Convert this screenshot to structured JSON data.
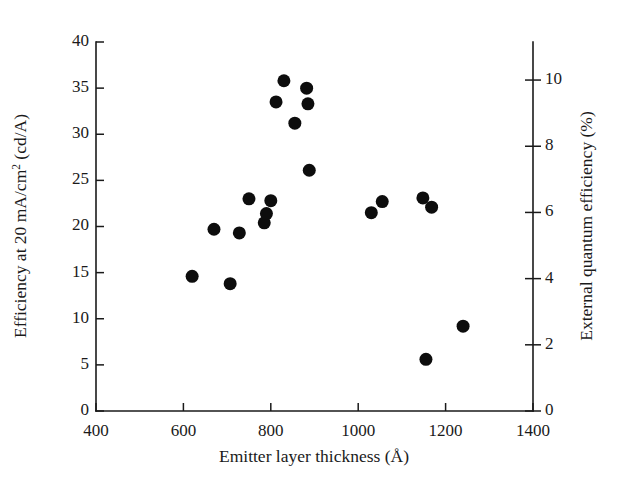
{
  "figure": {
    "background": "#ffffff",
    "marker_color": "#0d0d0d",
    "axis_color": "#1a1a1a"
  },
  "chart_data": {
    "type": "scatter",
    "title": "",
    "xlabel": "Emitter layer thickness (Å)",
    "ylabel": "Efficiency at 20 mA/cm² (cd/A)",
    "y2label": "External quantum efficiency (%)",
    "xlim": [
      400,
      1400
    ],
    "ylim": [
      0,
      40
    ],
    "y2lim": [
      0,
      11.15
    ],
    "xticks": [
      400,
      600,
      800,
      1000,
      1200,
      1400
    ],
    "xticklabels": [
      "400",
      "600",
      "800",
      "1000",
      "1200",
      "1400"
    ],
    "yticks": [
      0,
      5,
      10,
      15,
      20,
      25,
      30,
      35,
      40
    ],
    "yticklabels": [
      "0",
      "5",
      "10",
      "15",
      "20",
      "25",
      "30",
      "35",
      "40"
    ],
    "y2ticks": [
      0,
      2,
      4,
      6,
      8,
      10
    ],
    "y2ticklabels": [
      "0",
      "2",
      "4",
      "6",
      "8",
      "10"
    ],
    "grid": false,
    "legend": false,
    "marker": "filled-circle",
    "marker_size": 13,
    "series": [
      {
        "name": "devices",
        "points": [
          {
            "x": 620,
            "y": 14.6
          },
          {
            "x": 670,
            "y": 19.7
          },
          {
            "x": 707,
            "y": 13.8
          },
          {
            "x": 728,
            "y": 19.3
          },
          {
            "x": 750,
            "y": 23.0
          },
          {
            "x": 785,
            "y": 20.4
          },
          {
            "x": 790,
            "y": 21.4
          },
          {
            "x": 800,
            "y": 22.8
          },
          {
            "x": 812,
            "y": 33.5
          },
          {
            "x": 830,
            "y": 35.8
          },
          {
            "x": 855,
            "y": 31.2
          },
          {
            "x": 882,
            "y": 35.0
          },
          {
            "x": 885,
            "y": 33.3
          },
          {
            "x": 888,
            "y": 26.1
          },
          {
            "x": 1030,
            "y": 21.5
          },
          {
            "x": 1055,
            "y": 22.7
          },
          {
            "x": 1148,
            "y": 23.1
          },
          {
            "x": 1155,
            "y": 5.6
          },
          {
            "x": 1168,
            "y": 22.1
          },
          {
            "x": 1240,
            "y": 9.2
          }
        ]
      }
    ]
  },
  "axis_titles": {
    "x": "Emitter layer thickness (Å)",
    "y_left_pre": "Efficiency at 20 mA/cm",
    "y_left_sup": "2",
    "y_left_post": " (cd/A)",
    "y_right": "External quantum efficiency (%)"
  }
}
